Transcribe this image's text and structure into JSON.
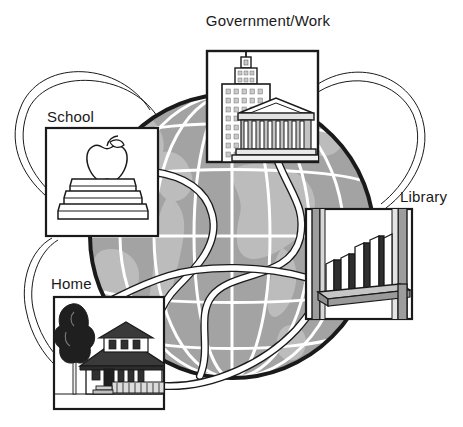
{
  "figure": {
    "kind": "concept-diagram",
    "background_color": "#ffffff"
  },
  "palette": {
    "ink": "#1a1a1a",
    "globe_fill": "#a3a3a3",
    "globe_land": "#b9b9b9",
    "globe_grid": "#ffffff",
    "globe_rim": "#1a1a1a",
    "panel_fill": "#ffffff",
    "panel_border": "#1a1a1a",
    "ribbon_fill": "#ffffff",
    "ribbon_stroke": "#1a1a1a",
    "shade_dark": "#3d3d3d",
    "shade_mid": "#808080",
    "shade_light": "#d4d4d4"
  },
  "globe": {
    "name": "earth-globe",
    "center_x": 232,
    "center_y": 236,
    "radius": 142,
    "grid_meridians": 7,
    "grid_parallels": 6
  },
  "panels": [
    {
      "id": "government-work",
      "label": "Government/Work",
      "label_x": 268,
      "label_y": 26,
      "label_anchor": "middle",
      "box": {
        "x": 207,
        "y": 51,
        "w": 111,
        "h": 111
      },
      "icon": "government-building-icon",
      "icon_description": "Skyscraper with spire beside a columned classical temple"
    },
    {
      "id": "school",
      "label": "School",
      "label_x": 47,
      "label_y": 122,
      "label_anchor": "start",
      "box": {
        "x": 46,
        "y": 128,
        "w": 112,
        "h": 108
      },
      "icon": "apple-on-books-icon",
      "icon_description": "Apple resting on a stack of three books"
    },
    {
      "id": "library",
      "label": "Library",
      "label_x": 400,
      "label_y": 202,
      "label_anchor": "start",
      "box": {
        "x": 306,
        "y": 209,
        "w": 106,
        "h": 110
      },
      "icon": "bookshelf-icon",
      "icon_description": "Wooden shelf holding eight upright books"
    },
    {
      "id": "home",
      "label": "Home",
      "label_x": 51,
      "label_y": 289,
      "label_anchor": "start",
      "box": {
        "x": 54,
        "y": 297,
        "w": 110,
        "h": 112
      },
      "icon": "house-with-tree-icon",
      "icon_description": "Bungalow house with dormer and porch, leafy tree at left"
    }
  ],
  "connectors": [
    {
      "id": "school-to-government",
      "name": "ribbon-school-government",
      "style": "outer-loop"
    },
    {
      "id": "government-to-library",
      "name": "ribbon-government-library",
      "style": "outer-loop"
    },
    {
      "id": "school-to-home",
      "name": "ribbon-school-home",
      "style": "outer-loop"
    },
    {
      "id": "government-across-globe",
      "name": "ribbon-government-globe",
      "style": "over-globe"
    },
    {
      "id": "school-across-globe",
      "name": "ribbon-school-globe",
      "style": "over-globe"
    },
    {
      "id": "library-across-globe",
      "name": "ribbon-library-globe",
      "style": "over-globe"
    },
    {
      "id": "home-across-globe",
      "name": "ribbon-home-globe",
      "style": "over-globe"
    }
  ]
}
